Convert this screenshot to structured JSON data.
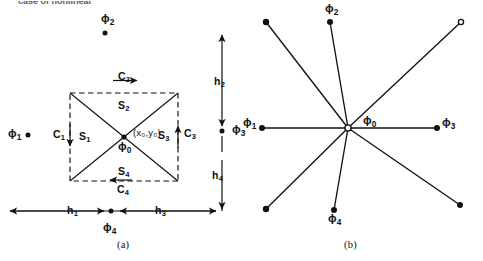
{
  "figure": {
    "cropped_header_text": "case of nonlinear",
    "panels": [
      {
        "id": "a",
        "caption": "(a)",
        "caption_x": 117,
        "caption_y": 240
      },
      {
        "id": "b",
        "caption": "(b)",
        "caption_y": 240,
        "caption_x": 344
      }
    ],
    "panel_a": {
      "description": "Dashed square cell with two diagonals, labelled sides C1-C4, sectors S1-S4, centre node and mesh spacings h1-h4",
      "box": {
        "left": 70,
        "top": 93,
        "right": 178,
        "bottom": 181
      },
      "center_node": {
        "x": 124,
        "y": 137
      },
      "coord_label": "(x₀,y₀)",
      "coord_label_plain": "(x",
      "nodes": [
        {
          "name": "phi1",
          "base": "ϕ",
          "sub": "1",
          "label_x": 8,
          "label_y": 128,
          "dot_x": 28,
          "dot_y": 135
        },
        {
          "name": "phi2",
          "base": "ϕ",
          "sub": "2",
          "label_x": 101,
          "label_y": 13,
          "dot_x": 105,
          "dot_y": 33
        },
        {
          "name": "phi3",
          "base": "ϕ",
          "sub": "3",
          "label_x": 232,
          "label_y": 124,
          "dot_x": 222,
          "dot_y": 131
        },
        {
          "name": "phi4",
          "base": "ϕ",
          "sub": "4",
          "label_x": 103,
          "label_y": 222,
          "dot_x": 111,
          "dot_y": 211
        },
        {
          "name": "phi0",
          "base": "ϕ",
          "sub": "0",
          "label_x": 118,
          "label_y": 141,
          "dot_x": 124,
          "dot_y": 137
        }
      ],
      "edge_labels": [
        {
          "name": "C2",
          "base": "C",
          "sub": "2",
          "x": 118,
          "y": 71,
          "arrow": "right"
        },
        {
          "name": "C4",
          "base": "C",
          "sub": "4",
          "x": 117,
          "y": 184,
          "arrow": "left"
        },
        {
          "name": "C1",
          "base": "C",
          "sub": "1",
          "x": 53,
          "y": 129,
          "arrow": "down"
        },
        {
          "name": "C3",
          "base": "C",
          "sub": "3",
          "x": 184,
          "y": 128,
          "arrow": "up"
        }
      ],
      "sector_labels": [
        {
          "name": "S1",
          "base": "S",
          "sub": "1",
          "x": 79,
          "y": 131
        },
        {
          "name": "S2",
          "base": "S",
          "sub": "2",
          "x": 118,
          "y": 100
        },
        {
          "name": "S3",
          "base": "S",
          "sub": "3",
          "x": 158,
          "y": 130
        },
        {
          "name": "S4",
          "base": "S",
          "sub": "4",
          "x": 118,
          "y": 166
        }
      ],
      "spacing_labels": [
        {
          "name": "h1",
          "base": "h",
          "sub": "1",
          "x": 67,
          "y": 205
        },
        {
          "name": "h2",
          "base": "h",
          "sub": "2",
          "x": 218,
          "y": 76
        },
        {
          "name": "h3",
          "base": "h",
          "sub": "3",
          "x": 155,
          "y": 205
        },
        {
          "name": "h4",
          "base": "h",
          "sub": "4",
          "x": 216,
          "y": 170
        }
      ]
    },
    "panel_b": {
      "description": "Eight-spoke star of neighbouring nodes about the central node",
      "center": {
        "x": 348,
        "y": 128
      },
      "spoke_endpoints": [
        {
          "dir": "up",
          "x": 330,
          "y": 22
        },
        {
          "dir": "down",
          "x": 334,
          "y": 210
        },
        {
          "dir": "left",
          "x": 262,
          "y": 128
        },
        {
          "dir": "right",
          "x": 437,
          "y": 128
        },
        {
          "dir": "up-left",
          "x": 266,
          "y": 22
        },
        {
          "dir": "up-right",
          "x": 461,
          "y": 22
        },
        {
          "dir": "down-left",
          "x": 266,
          "y": 209
        },
        {
          "dir": "down-right",
          "x": 460,
          "y": 205
        }
      ],
      "nodes": [
        {
          "name": "phi1",
          "base": "ϕ",
          "sub": "1",
          "label_x": 243,
          "label_y": 117
        },
        {
          "name": "phi2",
          "base": "ϕ",
          "sub": "2",
          "label_x": 325,
          "label_y": 3
        },
        {
          "name": "phi3",
          "base": "ϕ",
          "sub": "3",
          "label_x": 442,
          "label_y": 117
        },
        {
          "name": "phi4",
          "base": "ϕ",
          "sub": "4",
          "label_x": 328,
          "label_y": 222
        },
        {
          "name": "phi0",
          "base": "ϕ",
          "sub": "0",
          "label_x": 363,
          "label_y": 115
        }
      ]
    }
  },
  "style": {
    "ink": "#111111",
    "line": "#1a1a1a",
    "background": "#ffffff"
  }
}
